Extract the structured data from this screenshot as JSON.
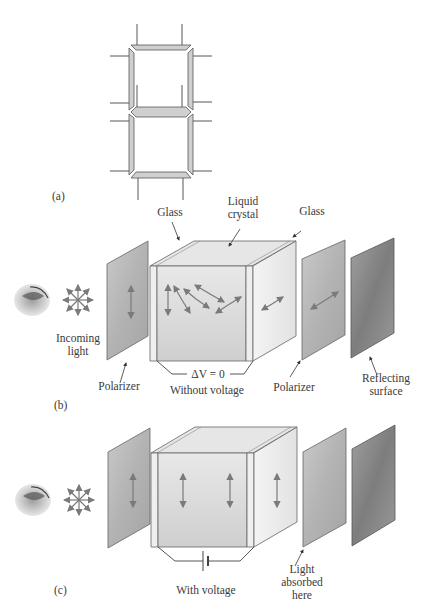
{
  "figure": {
    "panels": [
      {
        "id": "a",
        "tag": "(a)",
        "description": "seven-segment digit display"
      },
      {
        "id": "b",
        "tag": "(b)",
        "labels": {
          "glass_left": "Glass",
          "liquid_crystal_line1": "Liquid",
          "liquid_crystal_line2": "crystal",
          "glass_right": "Glass",
          "incoming_light_line1": "Incoming",
          "incoming_light_line2": "light",
          "polarizer_front": "Polarizer",
          "delta_v": "ΔV = 0",
          "condition": "Without voltage",
          "polarizer_back": "Polarizer",
          "reflecting_line1": "Reflecting",
          "reflecting_line2": "surface"
        }
      },
      {
        "id": "c",
        "tag": "(c)",
        "labels": {
          "condition": "With voltage",
          "absorbed_line1": "Light",
          "absorbed_line2": "absorbed",
          "absorbed_line3": "here"
        }
      }
    ],
    "colors": {
      "segment_fill": "#cfcfcf",
      "polarizer_fill": "#b5b5b5",
      "reflector_fill": "#8e8e8e",
      "cell_front": "#dedede",
      "cell_side": "#eeeeee",
      "arrow": "#7a7a7a"
    }
  }
}
